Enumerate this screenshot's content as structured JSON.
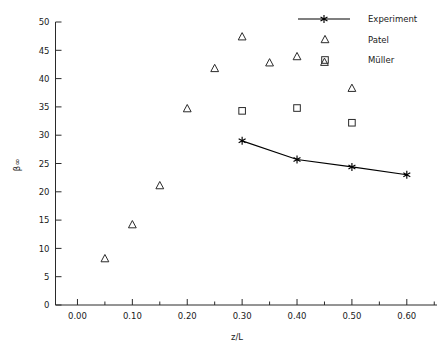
{
  "chart_data": {
    "type": "scatter",
    "title": "",
    "xlabel": "z/L",
    "ylabel": "β∞",
    "xlim": [
      -0.04,
      0.655
    ],
    "ylim": [
      0,
      50
    ],
    "grid": false,
    "legend_position": "top-right",
    "x_ticks": [
      "0.00",
      "0.10",
      "0.20",
      "0.30",
      "0.40",
      "0.50",
      "0.60"
    ],
    "x_tick_values": [
      0.0,
      0.1,
      0.2,
      0.3,
      0.4,
      0.5,
      0.6
    ],
    "x_minor_tick_values": [
      0.05,
      0.15,
      0.25,
      0.35,
      0.45,
      0.55,
      0.65
    ],
    "y_ticks": [
      "0",
      "5",
      "10",
      "15",
      "20",
      "25",
      "30",
      "35",
      "40",
      "45",
      "50"
    ],
    "y_tick_values": [
      0,
      5,
      10,
      15,
      20,
      25,
      30,
      35,
      40,
      45,
      50
    ],
    "series": [
      {
        "name": "Experiment",
        "marker": "star",
        "line": true,
        "color": "#000000",
        "x": [
          0.3,
          0.4,
          0.5,
          0.6
        ],
        "y": [
          29.0,
          25.7,
          24.4,
          23.0
        ]
      },
      {
        "name": "Patel",
        "marker": "triangle",
        "line": false,
        "color": "#2a2a2a",
        "x": [
          0.05,
          0.1,
          0.15,
          0.2,
          0.25,
          0.3,
          0.35,
          0.4,
          0.45,
          0.5
        ],
        "y": [
          8.2,
          14.2,
          21.1,
          34.7,
          41.8,
          47.4,
          42.8,
          43.9,
          42.9,
          38.3
        ]
      },
      {
        "name": "Müller",
        "marker": "square",
        "line": false,
        "color": "#2a2a2a",
        "x": [
          0.3,
          0.4,
          0.5
        ],
        "y": [
          34.3,
          34.8,
          32.2
        ]
      }
    ]
  },
  "legend": {
    "entries": [
      {
        "label": "Experiment",
        "marker": "star-with-line"
      },
      {
        "label": "Patel",
        "marker": "triangle"
      },
      {
        "label": "Müller",
        "marker": "square"
      }
    ]
  },
  "axes": {
    "x_axis_title": "z/L",
    "y_axis_title": "β∞"
  }
}
